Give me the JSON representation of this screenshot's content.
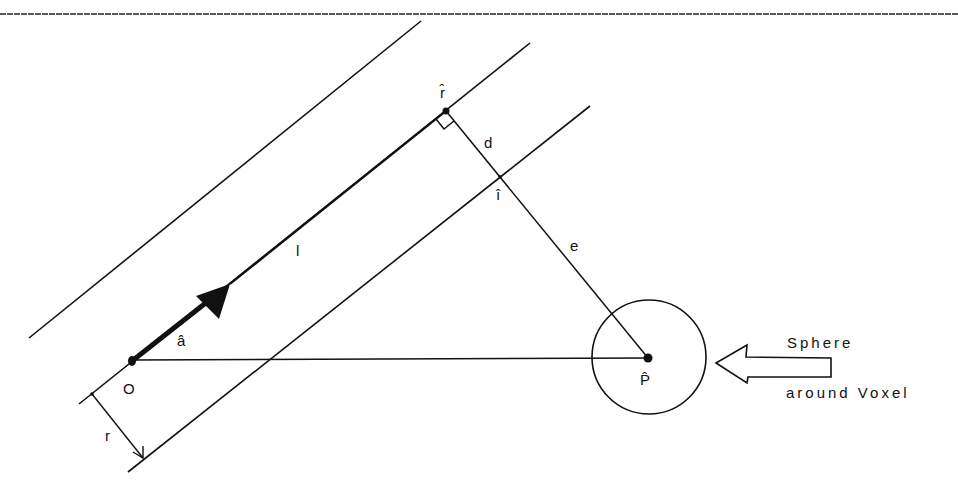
{
  "figure": {
    "type": "geometric-diagram",
    "colors": {
      "ink": "#111111",
      "background": "#ffffff"
    },
    "labels": {
      "origin": "O",
      "direction": "â",
      "length": "l",
      "ray_point": "r̂",
      "distance_d": "d",
      "intersection": "î",
      "distance_e": "e",
      "voxel_point": "P̂",
      "radius": "r"
    },
    "caption": {
      "line1": "Sphere",
      "line2": "around Voxel"
    }
  }
}
